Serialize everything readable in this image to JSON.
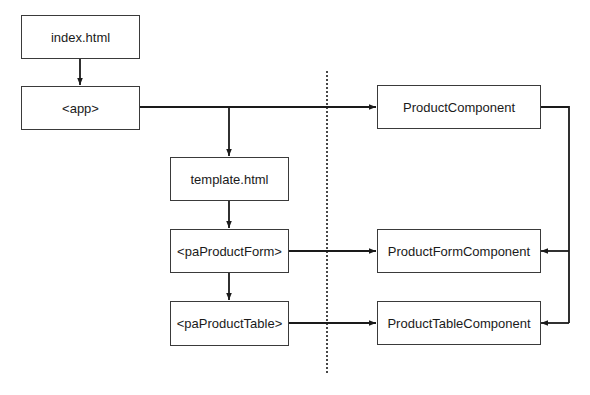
{
  "diagram": {
    "colors": {
      "line": "#1a1a1a",
      "box_border": "#3a3a3a",
      "text": "#1a1a1a",
      "background": "#ffffff"
    },
    "left_column": {
      "index": {
        "label": "index.html"
      },
      "app": {
        "label": "<app>"
      }
    },
    "middle_column": {
      "template": {
        "label": "template.html"
      },
      "product_form": {
        "label": "<paProductForm>"
      },
      "product_table": {
        "label": "<paProductTable>"
      }
    },
    "right_column": {
      "product_component": {
        "label": "ProductComponent"
      },
      "product_form_component": {
        "label": "ProductFormComponent"
      },
      "product_table_component": {
        "label": "ProductTableComponent"
      }
    },
    "separator": {
      "style": "dotted"
    },
    "edges": [
      {
        "from": "index.html",
        "to": "<app>"
      },
      {
        "from": "<app>",
        "to": "template.html"
      },
      {
        "from": "<app>",
        "to": "ProductComponent"
      },
      {
        "from": "template.html",
        "to": "<paProductForm>"
      },
      {
        "from": "<paProductForm>",
        "to": "<paProductTable>"
      },
      {
        "from": "<paProductForm>",
        "to": "ProductFormComponent"
      },
      {
        "from": "<paProductTable>",
        "to": "ProductTableComponent"
      },
      {
        "from": "ProductComponent",
        "to": "ProductFormComponent"
      },
      {
        "from": "ProductComponent",
        "to": "ProductTableComponent"
      }
    ]
  }
}
